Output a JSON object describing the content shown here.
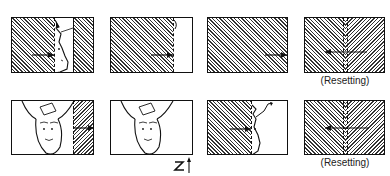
{
  "diagram": {
    "rows": [
      {
        "frames": [
          {
            "id": "r1f1",
            "content": "hatched left region, face profile, hatched right region",
            "arrow": "right"
          },
          {
            "id": "r1f2",
            "content": "hatched region covering most of frame",
            "arrow": "right"
          },
          {
            "id": "r1f3",
            "content": "fully hatched frame",
            "arrow": "right"
          },
          {
            "id": "r1f4",
            "content": "hatched frame with center divider",
            "arrow": "left",
            "label": "(Resetting)"
          }
        ]
      },
      {
        "frames": [
          {
            "id": "r2f1",
            "content": "inverted face with hatched right strip",
            "arrow": "right"
          },
          {
            "id": "r2f2",
            "content": "inverted face, no hatching",
            "arrow": "none",
            "symbol": "Z-arrow"
          },
          {
            "id": "r2f3",
            "content": "hatched left region, face profile",
            "arrow": "right"
          },
          {
            "id": "r2f4",
            "content": "hatched frame with center divider",
            "arrow": "left",
            "label": "(Resetting)"
          }
        ]
      }
    ],
    "labels": {
      "resetting_top": "(Resetting)",
      "resetting_bottom": "(Resetting)",
      "z_symbol": "Z"
    },
    "colors": {
      "line": "#111111",
      "hatch": "#333333",
      "background": "#ffffff"
    }
  }
}
